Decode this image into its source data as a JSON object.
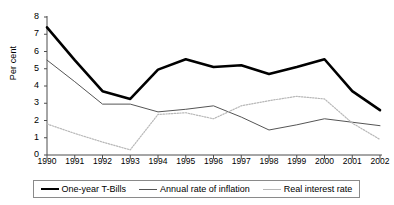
{
  "chart_data": {
    "type": "line",
    "title": "",
    "xlabel": "",
    "ylabel": "Per cent",
    "ylim": [
      0,
      8
    ],
    "yticks": [
      0,
      1,
      2,
      3,
      4,
      5,
      6,
      7,
      8
    ],
    "ytick_labels": [
      "0",
      "1",
      "2",
      "3",
      "4",
      "5",
      "6",
      "7",
      "8"
    ],
    "grid": false,
    "legend_position": "bottom",
    "categories": [
      "1990",
      "1991",
      "1992",
      "1993",
      "1994",
      "1995",
      "1996",
      "1997",
      "1998",
      "1999",
      "2000",
      "2001",
      "2002"
    ],
    "x": [
      1990,
      1991,
      1992,
      1993,
      1994,
      1995,
      1996,
      1997,
      1998,
      1999,
      2000,
      2001,
      2002
    ],
    "series": [
      {
        "name": "One-year T-Bills",
        "color": "#000000",
        "style": "solid-thick",
        "values": [
          7.4,
          5.5,
          3.7,
          3.25,
          4.95,
          5.55,
          5.1,
          5.2,
          4.7,
          5.1,
          5.55,
          3.7,
          2.6
        ]
      },
      {
        "name": "Annual rate of inflation",
        "color": "#555555",
        "style": "solid-thin",
        "values": [
          5.5,
          4.25,
          2.95,
          2.95,
          2.5,
          2.65,
          2.85,
          2.2,
          1.45,
          1.75,
          2.1,
          1.9,
          1.7
        ]
      },
      {
        "name": "Real interest rate",
        "color": "#b8b8b8",
        "style": "dotted",
        "values": [
          1.8,
          1.25,
          0.75,
          0.3,
          2.35,
          2.45,
          2.1,
          2.85,
          3.15,
          3.4,
          3.25,
          1.85,
          0.9
        ]
      }
    ]
  },
  "axis": {
    "y_title": "Per cent"
  },
  "legend": {
    "items": [
      {
        "label": "One-year T-Bills"
      },
      {
        "label": "Annual rate of inflation"
      },
      {
        "label": "Real interest rate"
      }
    ]
  }
}
